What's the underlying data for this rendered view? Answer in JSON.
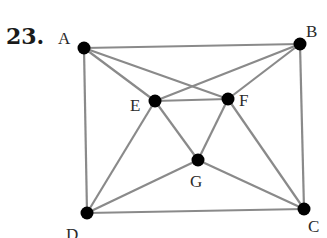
{
  "problem_number": "23.",
  "graph": {
    "vertices": [
      {
        "id": "A",
        "label": "A",
        "x": 84,
        "y": 48,
        "lx": 58,
        "ly": 44
      },
      {
        "id": "B",
        "label": "B",
        "x": 300,
        "y": 44,
        "lx": 306,
        "ly": 37
      },
      {
        "id": "C",
        "label": "C",
        "x": 304,
        "y": 209,
        "lx": 308,
        "ly": 232
      },
      {
        "id": "D",
        "label": "D",
        "x": 87,
        "y": 213,
        "lx": 66,
        "ly": 240
      },
      {
        "id": "E",
        "label": "E",
        "x": 155,
        "y": 101,
        "lx": 130,
        "ly": 111
      },
      {
        "id": "F",
        "label": "F",
        "x": 228,
        "y": 99,
        "lx": 239,
        "ly": 106
      },
      {
        "id": "G",
        "label": "G",
        "x": 198,
        "y": 160,
        "lx": 190,
        "ly": 187
      }
    ],
    "edges": [
      [
        "A",
        "B"
      ],
      [
        "A",
        "D"
      ],
      [
        "A",
        "E"
      ],
      [
        "A",
        "F"
      ],
      [
        "B",
        "C"
      ],
      [
        "B",
        "E"
      ],
      [
        "B",
        "F"
      ],
      [
        "C",
        "D"
      ],
      [
        "C",
        "F"
      ],
      [
        "C",
        "G"
      ],
      [
        "D",
        "E"
      ],
      [
        "D",
        "G"
      ],
      [
        "E",
        "F"
      ],
      [
        "E",
        "G"
      ],
      [
        "F",
        "G"
      ]
    ],
    "edge_color": "#8a8a8a",
    "vertex_color": "#000000"
  }
}
